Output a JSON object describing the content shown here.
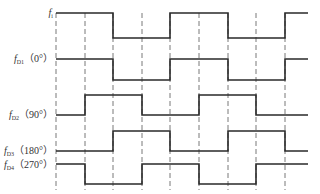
{
  "diagram": {
    "type": "timing-diagram",
    "signals": [
      {
        "id": "fi",
        "name": "f",
        "sub": "i",
        "phase": "",
        "high_y": 13,
        "low_y": 38,
        "label_y": 8,
        "start": "high",
        "transitions": [
          113,
          170,
          228,
          285
        ]
      },
      {
        "id": "fD1",
        "name": "f",
        "sub": "D1",
        "phase": "（0°）",
        "high_y": 59,
        "low_y": 80,
        "label_y": 54,
        "start": "high",
        "transitions": [
          113,
          170,
          228,
          285
        ]
      },
      {
        "id": "fD2",
        "name": "f",
        "sub": "D2",
        "phase": "（90°）",
        "high_y": 95,
        "low_y": 115,
        "label_y": 110,
        "start": "low",
        "transitions": [
          85,
          142,
          199,
          256
        ]
      },
      {
        "id": "fD3",
        "name": "f",
        "sub": "D3",
        "phase": "（180°）",
        "high_y": 131,
        "low_y": 151,
        "label_y": 146,
        "start": "low",
        "transitions": [
          113,
          170,
          228,
          285
        ]
      },
      {
        "id": "fD4",
        "name": "f",
        "sub": "D4",
        "phase": "（270°）",
        "high_y": 164,
        "low_y": 184,
        "label_y": 160,
        "start": "high",
        "transitions": [
          85,
          142,
          199,
          256
        ]
      }
    ],
    "x_start": 56,
    "x_end": 308,
    "dashed_lines_x": [
      56,
      85,
      113,
      142,
      170,
      199,
      228,
      256,
      285
    ],
    "dashed_y_top": 13,
    "dashed_y_bottom": 190,
    "colors": {
      "line": "#2a2a2a",
      "dash": "#555555",
      "text": "#333333"
    }
  }
}
